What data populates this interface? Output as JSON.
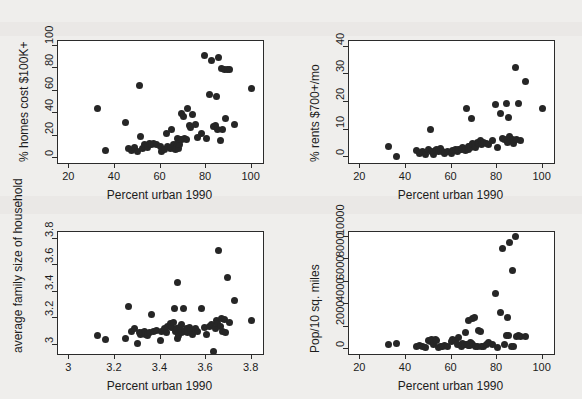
{
  "figure": {
    "background": "#efeeec",
    "panel_background": "#ffffff",
    "marker_color": "#262626",
    "axis_color": "#2b2b2b"
  },
  "chart_data": [
    {
      "id": "homes-cost",
      "type": "scatter",
      "title": "",
      "xlabel": "Percent urban 1990",
      "ylabel": "% homes cost $100K+",
      "xlim": [
        15,
        105
      ],
      "ylim": [
        -4,
        104
      ],
      "xticks": [
        20,
        40,
        60,
        80,
        100
      ],
      "yticks": [
        0,
        20,
        40,
        60,
        80,
        100
      ],
      "xticklabels": [
        "20",
        "40",
        "60",
        "80",
        "100"
      ],
      "yticklabels": [
        "0",
        "20",
        "40",
        "60",
        "80",
        "100"
      ],
      "grid": false,
      "legend": "none",
      "x": [
        32.2,
        35.9,
        44.6,
        45.9,
        47.3,
        48.6,
        50.1,
        50.8,
        51.3,
        52.2,
        53.0,
        53.6,
        54.4,
        55.1,
        56.0,
        57.0,
        58.4,
        60.1,
        60.6,
        61.7,
        62.5,
        63.0,
        64.2,
        65.0,
        65.6,
        66.1,
        66.5,
        66.9,
        67.3,
        67.6,
        68.0,
        68.3,
        68.6,
        69.0,
        69.4,
        69.9,
        70.5,
        71.2,
        72.0,
        72.6,
        73.3,
        74.1,
        75.2,
        76.4,
        78.0,
        79.4,
        80.2,
        81.5,
        82.6,
        83.4,
        84.0,
        84.5,
        85.0,
        85.6,
        86.2,
        86.8,
        87.4,
        88.0,
        88.6,
        89.3,
        90.2,
        92.4,
        100.0
      ],
      "y": [
        44.0,
        7.0,
        32.0,
        8.5,
        7.5,
        10.0,
        6.0,
        65.0,
        19.5,
        8.5,
        12.0,
        11.0,
        9.5,
        13.0,
        12.5,
        13.0,
        12.0,
        11.0,
        6.5,
        8.0,
        22.0,
        11.0,
        9.0,
        26.0,
        12.0,
        9.0,
        8.0,
        9.5,
        18.0,
        13.0,
        9.0,
        12.0,
        16.5,
        17.0,
        40.0,
        37.0,
        18.0,
        16.5,
        44.5,
        29.5,
        27.0,
        38.5,
        30.5,
        19.0,
        22.0,
        91.0,
        17.5,
        56.5,
        86.5,
        28.0,
        29.0,
        55.0,
        26.0,
        89.0,
        16.0,
        79.5,
        25.5,
        79.0,
        35.0,
        79.0,
        78.5,
        30.0,
        62.0
      ]
    },
    {
      "id": "rents",
      "type": "scatter",
      "title": "",
      "xlabel": "Percent urban 1990",
      "ylabel": "% rents $700+/mo",
      "xlim": [
        15,
        105
      ],
      "ylim": [
        -2,
        42
      ],
      "xticks": [
        20,
        40,
        60,
        80,
        100
      ],
      "yticks": [
        0,
        10,
        20,
        30,
        40
      ],
      "xticklabels": [
        "20",
        "40",
        "60",
        "80",
        "100"
      ],
      "yticklabels": [
        "0",
        "10",
        "20",
        "30",
        "40"
      ],
      "grid": false,
      "legend": "none",
      "x": [
        32.2,
        35.9,
        44.6,
        45.9,
        47.3,
        48.6,
        50.1,
        50.8,
        51.3,
        52.2,
        53.0,
        53.6,
        54.4,
        55.1,
        56.0,
        57.0,
        58.4,
        60.1,
        60.6,
        61.7,
        62.5,
        63.0,
        64.2,
        65.0,
        65.6,
        66.1,
        66.5,
        66.9,
        67.3,
        67.6,
        68.0,
        68.3,
        68.6,
        69.0,
        69.4,
        69.9,
        70.5,
        71.2,
        72.0,
        72.6,
        73.3,
        74.1,
        75.2,
        76.4,
        78.0,
        79.4,
        80.2,
        81.5,
        82.6,
        83.4,
        84.0,
        84.5,
        85.0,
        85.6,
        86.2,
        86.8,
        87.4,
        88.0,
        88.6,
        89.3,
        90.2,
        92.4,
        100.0
      ],
      "y": [
        3.8,
        0.4,
        2.5,
        1.5,
        2.0,
        1.0,
        2.8,
        10.0,
        2.0,
        1.2,
        2.5,
        3.0,
        2.0,
        3.2,
        2.0,
        1.6,
        2.2,
        1.5,
        2.5,
        3.0,
        2.2,
        3.0,
        2.8,
        3.5,
        3.0,
        2.5,
        17.5,
        3.2,
        4.0,
        3.0,
        3.8,
        3.5,
        14.0,
        4.5,
        5.0,
        4.5,
        3.5,
        5.5,
        5.0,
        6.0,
        4.5,
        5.5,
        5.0,
        4.5,
        6.0,
        19.0,
        3.5,
        16.0,
        7.0,
        6.5,
        19.5,
        5.5,
        14.5,
        7.5,
        6.0,
        6.5,
        5.0,
        32.5,
        6.5,
        19.5,
        6.0,
        27.5,
        17.8
      ]
    },
    {
      "id": "family-size",
      "type": "scatter",
      "title": "",
      "xlabel": "Percent urban 1990",
      "ylabel": "average family size of household",
      "xlim": [
        15,
        105
      ],
      "ylim": [
        2.93,
        3.85
      ],
      "xticks": [
        20,
        40,
        60,
        80,
        100
      ],
      "yticks": [
        3,
        3.2,
        3.4,
        3.6,
        3.8
      ],
      "xticklabels": [
        "3",
        "3.2",
        "3.4",
        "3.6",
        "3.8"
      ],
      "yticklabels": [
        "3",
        "3.2",
        "3.4",
        "3.6",
        "3.8"
      ],
      "grid": false,
      "legend": "none",
      "x": [
        32.2,
        35.9,
        44.6,
        45.9,
        47.3,
        48.6,
        50.1,
        50.8,
        51.3,
        52.2,
        53.0,
        53.6,
        54.4,
        55.1,
        56.0,
        57.0,
        58.4,
        60.1,
        60.6,
        61.7,
        62.5,
        63.0,
        64.2,
        65.0,
        65.6,
        66.1,
        66.5,
        66.9,
        67.3,
        67.6,
        68.0,
        68.3,
        68.6,
        69.0,
        69.4,
        69.9,
        70.5,
        71.2,
        72.0,
        72.6,
        73.3,
        74.1,
        75.2,
        76.4,
        78.0,
        79.4,
        80.2,
        81.5,
        82.6,
        83.4,
        84.0,
        84.5,
        85.0,
        85.6,
        86.2,
        86.8,
        87.4,
        88.0,
        88.6,
        89.3,
        90.2,
        92.4,
        100.0
      ],
      "y": [
        3.07,
        3.04,
        3.05,
        3.29,
        3.1,
        3.12,
        3.01,
        3.09,
        3.08,
        3.09,
        3.1,
        3.08,
        3.07,
        3.09,
        3.23,
        3.1,
        3.11,
        3.03,
        3.1,
        3.12,
        3.09,
        3.14,
        3.16,
        3.13,
        3.17,
        3.27,
        3.1,
        3.12,
        3.05,
        3.47,
        3.07,
        3.13,
        3.11,
        3.09,
        3.15,
        3.27,
        3.1,
        3.12,
        3.09,
        3.13,
        3.11,
        3.08,
        3.12,
        3.1,
        3.27,
        3.13,
        3.08,
        3.14,
        3.15,
        2.95,
        3.12,
        3.18,
        3.16,
        3.71,
        3.14,
        3.2,
        3.1,
        3.19,
        3.09,
        3.51,
        3.17,
        3.33,
        3.18
      ]
    },
    {
      "id": "pop-density",
      "type": "scatter",
      "title": "",
      "xlabel": "Percent urban 1990",
      "ylabel": "Pop/10 sq. miles",
      "xlim": [
        15,
        105
      ],
      "ylim": [
        -400,
        10400
      ],
      "xticks": [
        20,
        40,
        60,
        80,
        100
      ],
      "yticks": [
        0,
        2000,
        4000,
        6000,
        8000,
        10000
      ],
      "xticklabels": [
        "20",
        "40",
        "60",
        "80",
        "100"
      ],
      "yticklabels": [
        "0",
        "2000",
        "4000",
        "6000",
        "8000",
        "10000"
      ],
      "grid": false,
      "legend": "none",
      "x": [
        32.2,
        35.9,
        44.6,
        45.9,
        47.3,
        48.6,
        50.1,
        50.8,
        51.3,
        52.2,
        53.0,
        53.6,
        54.4,
        55.1,
        56.0,
        57.0,
        58.4,
        60.1,
        60.6,
        61.7,
        62.5,
        63.0,
        64.2,
        65.0,
        65.6,
        66.1,
        66.5,
        66.9,
        67.3,
        67.6,
        68.0,
        68.3,
        68.6,
        69.0,
        69.4,
        69.9,
        70.5,
        71.2,
        72.0,
        72.6,
        73.3,
        74.1,
        75.2,
        76.4,
        78.0,
        79.4,
        80.2,
        81.5,
        82.6,
        83.4,
        84.0,
        84.5,
        85.0,
        85.6,
        86.2,
        86.8,
        87.4,
        88.0,
        88.6,
        89.3,
        90.2,
        92.4
      ],
      "y": [
        420,
        520,
        300,
        330,
        250,
        150,
        800,
        700,
        900,
        400,
        850,
        780,
        200,
        300,
        260,
        320,
        230,
        700,
        900,
        760,
        450,
        1100,
        250,
        520,
        400,
        1500,
        420,
        480,
        380,
        2600,
        350,
        600,
        500,
        450,
        2700,
        2800,
        300,
        260,
        1700,
        1600,
        280,
        240,
        400,
        600,
        420,
        5000,
        200,
        3250,
        8900,
        400,
        1200,
        2800,
        1250,
        9500,
        250,
        7000,
        260,
        10000,
        1150,
        1200,
        1150,
        1150
      ]
    }
  ]
}
